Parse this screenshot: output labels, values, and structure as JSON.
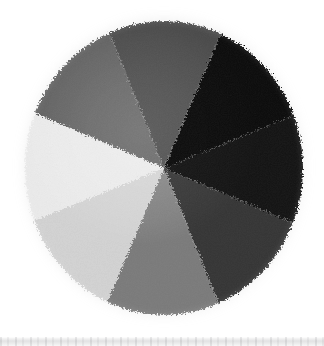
{
  "figure": {
    "caption": "Circular specimen divided into eight pie wedges of graded gray value",
    "background_color": "#ffffff",
    "width": 324,
    "height": 346
  },
  "disc": {
    "name": "eight-wedge-gray-disc",
    "center_x": 164,
    "center_y": 168,
    "radius_x": 140,
    "radius_y": 148,
    "edge_description": "ragged furry rim",
    "halo_color": "#969696"
  },
  "lower_strip": {
    "name": "partial-image-strip",
    "description": "top sliver of a second photograph below",
    "base_color": "#e2e2e3",
    "top_y": 337,
    "height": 9
  },
  "chart_data": {
    "type": "pie",
    "xlabel": "",
    "ylabel": "",
    "legend_position": "none",
    "grid": false,
    "categories": [
      "Wedge 1 (N, black)",
      "Wedge 2 (NE, near-black)",
      "Wedge 3 (E, dark gray)",
      "Wedge 4 (SE, mid-light gray)",
      "Wedge 5 (S, near-white)",
      "Wedge 6 (SW, white)",
      "Wedge 7 (W, mid gray)",
      "Wedge 8 (NW, dark mid gray)"
    ],
    "values": [
      45,
      45,
      45,
      45,
      45,
      45,
      45,
      45
    ],
    "start_angle_deg": -67,
    "wedges": [
      {
        "index": 0,
        "label": "Wedge 1 (N, black)",
        "angle_start": -67,
        "angle_end": -22,
        "gray_level": 8,
        "color": "#080808"
      },
      {
        "index": 1,
        "label": "Wedge 2 (NE, near-black)",
        "angle_start": -22,
        "angle_end": 23,
        "gray_level": 20,
        "color": "#141414"
      },
      {
        "index": 2,
        "label": "Wedge 3 (E, dark gray)",
        "angle_start": 23,
        "angle_end": 68,
        "gray_level": 61,
        "color": "#3d3d3d"
      },
      {
        "index": 3,
        "label": "Wedge 4 (SE, mid-light gray)",
        "angle_start": 68,
        "angle_end": 113,
        "gray_level": 138,
        "color": "#8a8a8a"
      },
      {
        "index": 4,
        "label": "Wedge 5 (S, near-white)",
        "angle_start": 113,
        "angle_end": 158,
        "gray_level": 216,
        "color": "#d8d8d8"
      },
      {
        "index": 5,
        "label": "Wedge 6 (SW, white)",
        "angle_start": 158,
        "angle_end": 203,
        "gray_level": 238,
        "color": "#eeeeee"
      },
      {
        "index": 6,
        "label": "Wedge 7 (W, mid gray)",
        "angle_start": 203,
        "angle_end": 248,
        "gray_level": 110,
        "color": "#6e6e6e"
      },
      {
        "index": 7,
        "label": "Wedge 8 (NW, dark mid gray)",
        "angle_start": 248,
        "angle_end": 293,
        "gray_level": 85,
        "color": "#555555"
      }
    ]
  }
}
